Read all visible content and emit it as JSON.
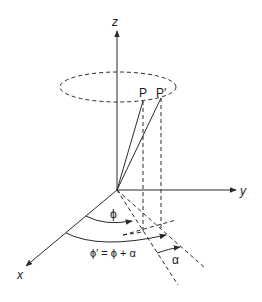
{
  "diagram": {
    "axes": {
      "x_label": "x",
      "y_label": "y",
      "z_label": "z"
    },
    "points": {
      "p_label": "P",
      "p_prime_label": "P′"
    },
    "angles": {
      "phi_label": "ϕ",
      "phi_prime_label": "ϕ′ = ϕ + α",
      "alpha_label": "α"
    },
    "colors": {
      "line": "#2a2a2a",
      "background": "#ffffff"
    }
  }
}
